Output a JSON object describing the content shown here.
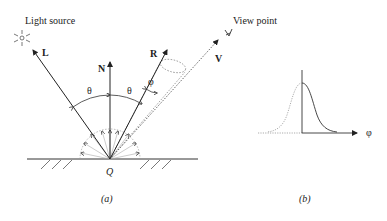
{
  "figure": {
    "panel_a": {
      "caption": "(a)",
      "labels": {
        "light_source": "Light source",
        "view_point": "View point",
        "L": "L",
        "N": "N",
        "R": "R",
        "V": "V",
        "theta_left": "θ",
        "theta_right": "θ",
        "phi": "φ",
        "Q": "Q"
      }
    },
    "panel_b": {
      "caption": "(b)",
      "axis_label": "φ"
    }
  }
}
